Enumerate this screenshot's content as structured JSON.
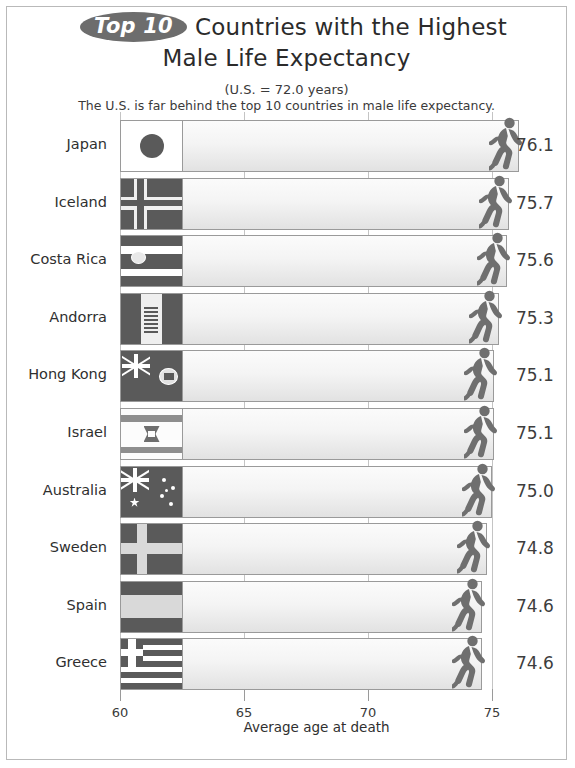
{
  "header": {
    "badge": "Top 10",
    "title_line1": "Countries with the Highest",
    "title_line2": "Male Life Expectancy",
    "subtitle1": "(U.S. = 72.0 years)",
    "subtitle2": "The U.S. is far behind the top 10 countries in male life expectancy."
  },
  "colors": {
    "badge_fill": "#6d6d6d",
    "bar_outline": "#9a9a9a",
    "runner": "#6f6f6f",
    "gridline": "#c4c4c4",
    "frame": "#b9b9b9",
    "flag_dark": "#5a5a5a",
    "flag_light": "#d9d9d9"
  },
  "chart_data": {
    "type": "bar",
    "subtitle": "The U.S. is far behind the top 10 countries in male life expectancy.",
    "xlabel": "Average age at death",
    "ylabel": "",
    "orientation": "horizontal",
    "xlim": [
      60,
      75
    ],
    "xticks": [
      60,
      65,
      70,
      75
    ],
    "xtick_labels": [
      "60",
      "65",
      "70",
      "75"
    ],
    "grid": true,
    "legend": false,
    "reference_value": 72.0,
    "reference_label": "U.S. = 72.0 years",
    "categories": [
      "Japan",
      "Iceland",
      "Costa Rica",
      "Andorra",
      "Hong Kong",
      "Israel",
      "Australia",
      "Sweden",
      "Spain",
      "Greece"
    ],
    "values": [
      76.1,
      75.7,
      75.6,
      75.3,
      75.1,
      75.1,
      75.0,
      74.8,
      74.6,
      74.6
    ],
    "value_labels": [
      "76.1",
      "75.7",
      "75.6",
      "75.3",
      "75.1",
      "75.1",
      "75.0",
      "74.8",
      "74.6",
      "74.6"
    ],
    "flags": [
      "japan",
      "iceland",
      "costa-rica",
      "andorra",
      "hong-kong",
      "israel",
      "australia",
      "sweden",
      "spain",
      "greece"
    ]
  },
  "axis": {
    "title": "Average age at death"
  },
  "icons": {
    "runner": "runner-icon"
  }
}
